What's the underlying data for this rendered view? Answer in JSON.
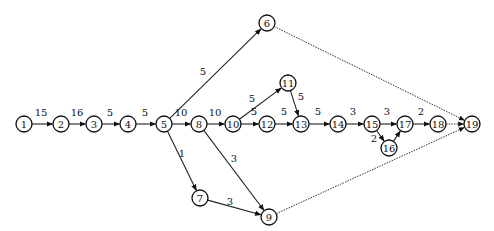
{
  "diagram": {
    "type": "activity-network",
    "nodes": [
      {
        "id": "1",
        "label": "1",
        "x": 24,
        "y": 124
      },
      {
        "id": "2",
        "label": "2",
        "x": 61,
        "y": 124
      },
      {
        "id": "3",
        "label": "3",
        "x": 94,
        "y": 124
      },
      {
        "id": "4",
        "label": "4",
        "x": 128,
        "y": 124
      },
      {
        "id": "5",
        "label": "5",
        "x": 164,
        "y": 124
      },
      {
        "id": "6",
        "label": "6",
        "x": 267,
        "y": 23
      },
      {
        "id": "7",
        "label": "7",
        "x": 200,
        "y": 198
      },
      {
        "id": "8",
        "label": "8",
        "x": 199,
        "y": 124
      },
      {
        "id": "9",
        "label": "9",
        "x": 269,
        "y": 217
      },
      {
        "id": "10",
        "label": "10",
        "x": 233,
        "y": 124
      },
      {
        "id": "11",
        "label": "11",
        "x": 288,
        "y": 83
      },
      {
        "id": "12",
        "label": "12",
        "x": 267,
        "y": 124
      },
      {
        "id": "13",
        "label": "13",
        "x": 301,
        "y": 124
      },
      {
        "id": "14",
        "label": "14",
        "x": 338,
        "y": 124
      },
      {
        "id": "15",
        "label": "15",
        "x": 372,
        "y": 124
      },
      {
        "id": "16",
        "label": "16",
        "x": 389,
        "y": 148
      },
      {
        "id": "17",
        "label": "17",
        "x": 405,
        "y": 124
      },
      {
        "id": "18",
        "label": "18",
        "x": 438,
        "y": 124
      },
      {
        "id": "19",
        "label": "19",
        "x": 472,
        "y": 124
      }
    ],
    "edges": [
      {
        "from": "1",
        "to": "2",
        "label": "15",
        "lx": 41,
        "ly": 112
      },
      {
        "from": "2",
        "to": "3",
        "label": "16",
        "lx": 77,
        "ly": 112
      },
      {
        "from": "3",
        "to": "4",
        "label": "5",
        "lx": 110,
        "ly": 112
      },
      {
        "from": "4",
        "to": "5",
        "label": "5",
        "lx": 145,
        "ly": 112
      },
      {
        "from": "5",
        "to": "6",
        "label": "5",
        "lx": 203,
        "ly": 71
      },
      {
        "from": "5",
        "to": "8",
        "label": "10",
        "lx": 181,
        "ly": 112
      },
      {
        "from": "5",
        "to": "7",
        "label": "1",
        "lx": 182,
        "ly": 153
      },
      {
        "from": "8",
        "to": "10",
        "label": "10",
        "lx": 215,
        "ly": 112
      },
      {
        "from": "8",
        "to": "9",
        "label": "3",
        "lx": 234,
        "ly": 158
      },
      {
        "from": "10",
        "to": "11",
        "label": "5",
        "lx": 252,
        "ly": 98
      },
      {
        "from": "10",
        "to": "12",
        "label": "5",
        "lx": 254,
        "ly": 111
      },
      {
        "from": "11",
        "to": "13",
        "label": "5",
        "lx": 301,
        "ly": 96
      },
      {
        "from": "12",
        "to": "13",
        "label": "5",
        "lx": 284,
        "ly": 111
      },
      {
        "from": "13",
        "to": "14",
        "label": "5",
        "lx": 318,
        "ly": 111
      },
      {
        "from": "14",
        "to": "15",
        "label": "3",
        "lx": 353,
        "ly": 111
      },
      {
        "from": "15",
        "to": "17",
        "label": "3",
        "lx": 387,
        "ly": 111
      },
      {
        "from": "15",
        "to": "16",
        "label": "2",
        "lx": 374,
        "ly": 138
      },
      {
        "from": "16",
        "to": "17",
        "label": "",
        "lx": 0,
        "ly": 0
      },
      {
        "from": "17",
        "to": "18",
        "label": "2",
        "lx": 421,
        "ly": 111
      },
      {
        "from": "18",
        "to": "19",
        "label": "",
        "lx": 0,
        "ly": 0,
        "style": "dotted"
      },
      {
        "from": "7",
        "to": "9",
        "label": "3",
        "lx": 230,
        "ly": 201
      },
      {
        "from": "6",
        "to": "19",
        "label": "",
        "lx": 0,
        "ly": 0,
        "style": "dotted"
      },
      {
        "from": "9",
        "to": "19",
        "label": "",
        "lx": 0,
        "ly": 0,
        "style": "dotted"
      }
    ]
  }
}
